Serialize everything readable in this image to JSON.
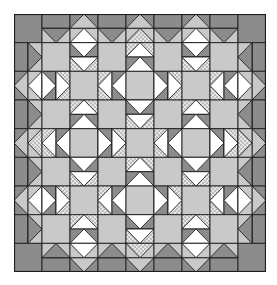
{
  "colors": {
    "dark": "#8c8c8c",
    "light": "#c9c9c9",
    "white": "#ffffff",
    "speckle_bg": "#e6e6e6",
    "speckle_dot": "#8a8a8a",
    "line": "#1e1e1e"
  },
  "grid": {
    "cols": 9,
    "rows": 9,
    "cell_w": 28,
    "cell_h": 28.67
  },
  "legend": {
    "dark": "dark fabric",
    "light": "light gray fabric",
    "white": "white fabric",
    "speckle": "speckled fabric"
  },
  "border": {
    "corner": "dark",
    "odd_cells": {
      "outer": "dark-band",
      "inner": "dark triangle pointing inward on light"
    },
    "even_cells": {
      "outer": "light triangle pointing outward on dark",
      "inner_center": "speckle",
      "inner_other": "white"
    }
  },
  "star_centers": [
    [
      2,
      2
    ],
    [
      2,
      6
    ],
    [
      6,
      2
    ],
    [
      6,
      6
    ],
    [
      4,
      4
    ],
    [
      0,
      4
    ],
    [
      4,
      0
    ],
    [
      4,
      8
    ],
    [
      8,
      4
    ]
  ],
  "goose_fabric": {
    "inner": "speckle",
    "outer": "dark"
  }
}
